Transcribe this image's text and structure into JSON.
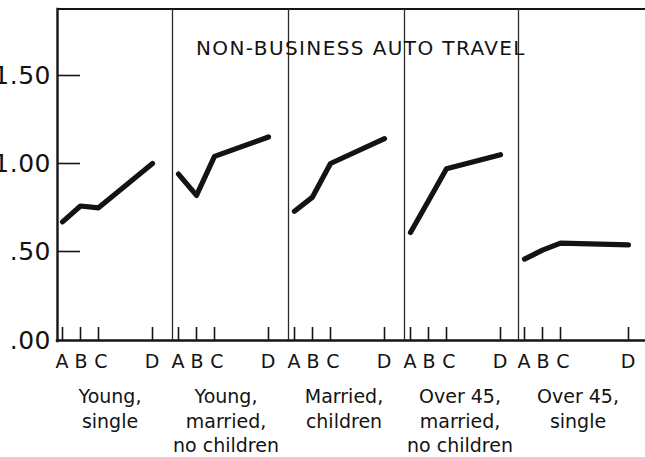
{
  "chart_data": {
    "type": "line",
    "title": "NON-BUSINESS AUTO TRAVEL",
    "xlabel": "",
    "ylabel": "",
    "ylim": [
      0.0,
      1.75
    ],
    "yticks": [
      0.0,
      0.5,
      1.0,
      1.5
    ],
    "ytick_labels": [
      ".00",
      ".50",
      "1.00",
      "1.50"
    ],
    "grid": false,
    "legend": "none",
    "panels": [
      {
        "group_label_lines": [
          "Young,",
          "single"
        ],
        "categories": [
          "A",
          "B",
          "C",
          "D"
        ],
        "values": [
          0.67,
          0.76,
          0.75,
          1.0
        ]
      },
      {
        "group_label_lines": [
          "Young,",
          "married,",
          "no children"
        ],
        "categories": [
          "A",
          "B",
          "C",
          "D"
        ],
        "values": [
          0.94,
          0.82,
          1.04,
          1.15
        ]
      },
      {
        "group_label_lines": [
          "Married,",
          "children"
        ],
        "categories": [
          "A",
          "B",
          "C",
          "D"
        ],
        "values": [
          0.73,
          0.81,
          1.0,
          1.14
        ]
      },
      {
        "group_label_lines": [
          "Over 45,",
          "married,",
          "no children"
        ],
        "categories": [
          "A",
          "B",
          "C",
          "D"
        ],
        "values": [
          0.61,
          0.79,
          0.97,
          1.05
        ]
      },
      {
        "group_label_lines": [
          "Over 45,",
          "single"
        ],
        "categories": [
          "A",
          "B",
          "C",
          "D"
        ],
        "values": [
          0.46,
          0.51,
          0.55,
          0.54
        ]
      }
    ]
  },
  "axis": {
    "ytick_1_50": "1.50",
    "ytick_1_00": "1.00",
    "ytick_0_50": ".50",
    "ytick_0_00": ".00"
  },
  "title": {
    "text": "NON-BUSINESS AUTO TRAVEL"
  },
  "panels": {
    "p0": {
      "a": "A",
      "b": "B",
      "c": "C",
      "d": "D",
      "l1": "Young,",
      "l2": "single",
      "l3": ""
    },
    "p1": {
      "a": "A",
      "b": "B",
      "c": "C",
      "d": "D",
      "l1": "Young,",
      "l2": "married,",
      "l3": "no children"
    },
    "p2": {
      "a": "A",
      "b": "B",
      "c": "C",
      "d": "D",
      "l1": "Married,",
      "l2": "children",
      "l3": ""
    },
    "p3": {
      "a": "A",
      "b": "B",
      "c": "C",
      "d": "D",
      "l1": "Over 45,",
      "l2": "married,",
      "l3": "no children"
    },
    "p4": {
      "a": "A",
      "b": "B",
      "c": "C",
      "d": "D",
      "l1": "Over 45,",
      "l2": "single",
      "l3": ""
    }
  },
  "colors": {
    "ink": "#131313",
    "background": "#ffffff"
  }
}
